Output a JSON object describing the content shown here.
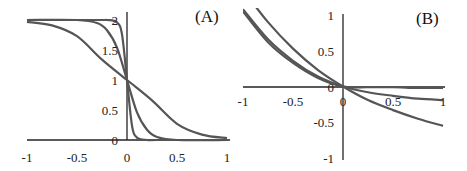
{
  "chart_data": [
    {
      "type": "line",
      "panel_label": "(A)",
      "title": "",
      "xlabel": "",
      "ylabel": "",
      "xlim": [
        -1,
        1
      ],
      "ylim": [
        0,
        2
      ],
      "x_ticks": [
        "-1",
        "-0.5",
        "0",
        "0.5",
        "1"
      ],
      "y_ticks": [
        "0",
        "0.5",
        "1",
        "1.5",
        "2"
      ],
      "grid": false,
      "legend": null,
      "series": [
        {
          "name": "steep",
          "x": [
            -1,
            -0.3,
            -0.2,
            -0.1,
            -0.05,
            0,
            0.05,
            0.1,
            0.2,
            0.3,
            1
          ],
          "values": [
            2.0,
            2.0,
            2.0,
            1.96,
            1.76,
            1.0,
            0.24,
            0.04,
            0.0,
            0.0,
            0.0
          ]
        },
        {
          "name": "medium",
          "x": [
            -1,
            -0.5,
            -0.3,
            -0.2,
            -0.1,
            0,
            0.1,
            0.2,
            0.3,
            0.5,
            1
          ],
          "values": [
            2.0,
            2.0,
            1.95,
            1.83,
            1.54,
            1.0,
            0.46,
            0.17,
            0.05,
            0.0,
            0.0
          ]
        },
        {
          "name": "gentle",
          "x": [
            -1,
            -0.75,
            -0.5,
            -0.25,
            0,
            0.25,
            0.5,
            0.75,
            1
          ],
          "values": [
            1.97,
            1.91,
            1.73,
            1.34,
            1.0,
            0.66,
            0.27,
            0.09,
            0.03
          ]
        }
      ]
    },
    {
      "type": "line",
      "panel_label": "(B)",
      "title": "",
      "xlabel": "",
      "ylabel": "",
      "xlim": [
        -1,
        1
      ],
      "ylim": [
        -1,
        1
      ],
      "x_ticks": [
        "-1",
        "-0.5",
        "0",
        "0.5",
        "1"
      ],
      "y_ticks": [
        "-1",
        "-0.5",
        "0",
        "0.5",
        "1"
      ],
      "grid": false,
      "legend": null,
      "series": [
        {
          "name": "curve-1",
          "x": [
            -1,
            -0.75,
            -0.5,
            -0.25,
            0,
            0.25,
            0.5,
            0.75,
            1
          ],
          "values": [
            1.05,
            0.62,
            0.33,
            0.12,
            0.0,
            -0.01,
            -0.01,
            -0.02,
            -0.02
          ]
        },
        {
          "name": "curve-2",
          "x": [
            -1,
            -0.75,
            -0.5,
            -0.25,
            0,
            0.25,
            0.5,
            0.75,
            1
          ],
          "values": [
            1.08,
            0.66,
            0.36,
            0.14,
            0.0,
            -0.08,
            -0.13,
            -0.17,
            -0.19
          ]
        },
        {
          "name": "curve-3",
          "x": [
            -1,
            -0.75,
            -0.5,
            -0.25,
            0,
            0.25,
            0.5,
            0.75,
            1
          ],
          "values": [
            1.35,
            0.9,
            0.53,
            0.23,
            0.0,
            -0.19,
            -0.33,
            -0.45,
            -0.55
          ]
        }
      ]
    }
  ]
}
